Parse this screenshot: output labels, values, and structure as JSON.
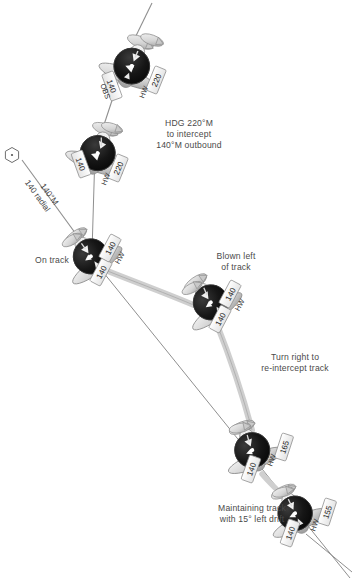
{
  "diagram": {
    "type": "aviation-navigation-diagram",
    "colors": {
      "background": "#ffffff",
      "text": "#4a4a4a",
      "instrument_face": "#141414",
      "aircraft_body": "#d8d8d8",
      "aircraft_shade": "#a8a8a8",
      "track_line": "#8c8c8c",
      "path_line": "#c9c9c9",
      "vor_symbol": "#ffffff",
      "vor_outline": "#6e6e6e"
    }
  },
  "vor": {
    "symbol_name": "vor-hexagon",
    "radial_label_line1": "140°M",
    "radial_label_line2": "140 radial"
  },
  "annotations": [
    {
      "id": "hdg-intercept",
      "lines": [
        "HDG 220°M",
        "to intercept",
        "140°M outbound"
      ],
      "text": "HDG 220°M\nto intercept\n140°M outbound"
    },
    {
      "id": "on-track",
      "lines": [
        "On track"
      ],
      "text": "On track"
    },
    {
      "id": "blown-left",
      "lines": [
        "Blown left",
        "of track"
      ],
      "text": "Blown left\nof track"
    },
    {
      "id": "turn-right",
      "lines": [
        "Turn right to",
        "re-intercept track"
      ],
      "text": "Turn right to\nre-intercept track"
    },
    {
      "id": "maintaining-track",
      "lines": [
        "Maintaining track",
        "with 15° left drift"
      ],
      "text": "Maintaining track\nwith 15° left drift"
    }
  ],
  "aircraft": [
    {
      "id": "ac-1",
      "position_note": "top, turning inbound on 220 heading",
      "obs_prefix": "OBS",
      "obs": "140",
      "hw_prefix": "HW",
      "hw": "220",
      "heading_deg": 220,
      "cdi": "deflected"
    },
    {
      "id": "ac-2",
      "position_note": "second, intercepting outbound radial",
      "obs_prefix": "",
      "obs": "140",
      "hw_prefix": "HW",
      "hw": "220",
      "heading_deg": 220,
      "cdi": "closing"
    },
    {
      "id": "ac-3",
      "position_note": "established on track",
      "obs_prefix": "",
      "obs": "140",
      "hw_prefix": "HW",
      "hw": "140",
      "heading_deg": 140,
      "cdi": "centred"
    },
    {
      "id": "ac-4",
      "position_note": "blown left of track",
      "obs_prefix": "",
      "obs": "140",
      "hw_prefix": "HW",
      "hw": "140",
      "heading_deg": 140,
      "cdi": "right-deflection"
    },
    {
      "id": "ac-5",
      "position_note": "turned right to re-intercept",
      "obs_prefix": "",
      "obs": "140",
      "hw_prefix": "HW",
      "hw": "165",
      "heading_deg": 165,
      "cdi": "closing"
    },
    {
      "id": "ac-6",
      "position_note": "maintaining track with drift correction",
      "obs_prefix": "",
      "obs": "140",
      "hw_prefix": "HW",
      "hw": "155",
      "heading_deg": 155,
      "cdi": "centred"
    }
  ]
}
